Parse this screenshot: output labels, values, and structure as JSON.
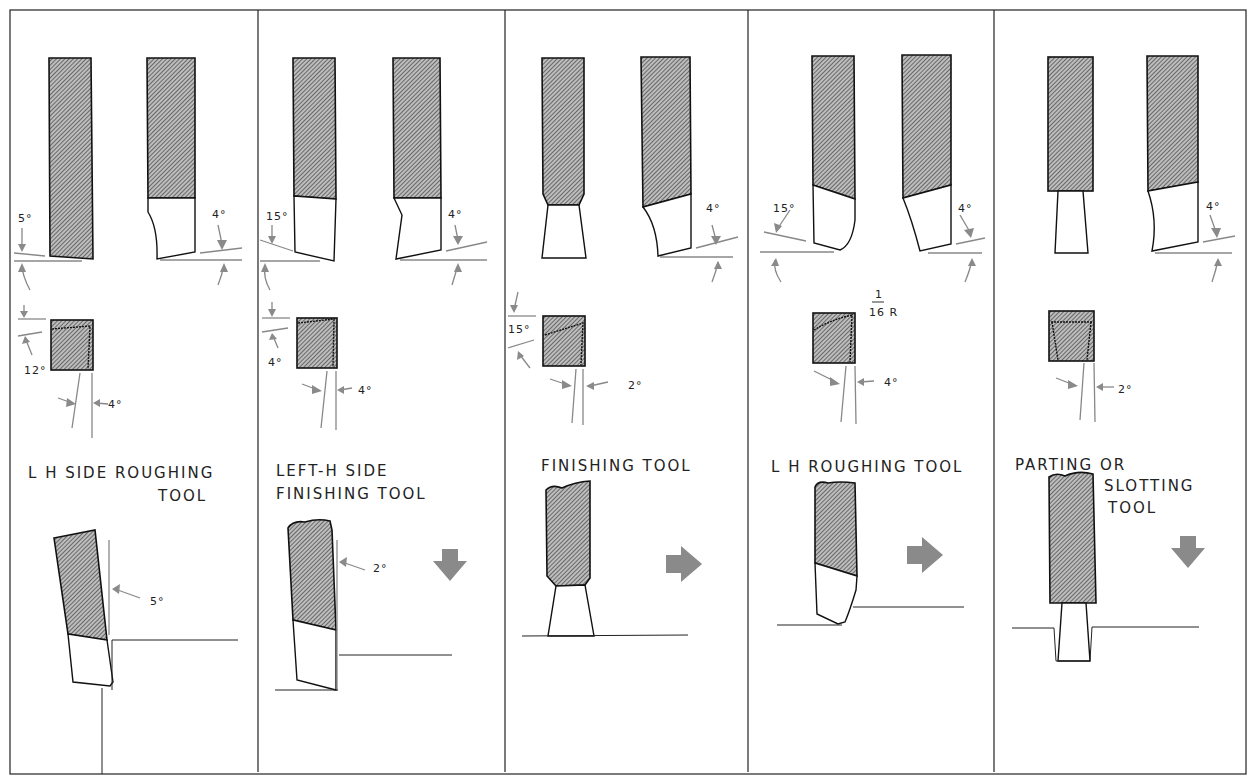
{
  "figure": {
    "type": "technical-drawing",
    "panels": [
      {
        "id": "lh-side-roughing",
        "title_line1": "L H SIDE ROUGHING",
        "title_line2": "TOOL",
        "angles": {
          "side_view_left": "5°",
          "side_view_right": "4°",
          "end_view_top": "12°",
          "end_view_bottom": "4°",
          "usage": "5°"
        },
        "feed_arrow": "none"
      },
      {
        "id": "left-h-side-finishing",
        "title_line1": "LEFT-H  SIDE",
        "title_line2": "FINISHING TOOL",
        "angles": {
          "side_view_left": "15°",
          "side_view_right": "4°",
          "end_view_top": "4°",
          "end_view_bottom": "4°",
          "usage": "2°"
        },
        "feed_arrow": "down"
      },
      {
        "id": "finishing",
        "title_line1": "FINISHING  TOOL",
        "title_line2": "",
        "angles": {
          "side_view_right": "4°",
          "end_view_top": "15°",
          "end_view_bottom": "2°"
        },
        "feed_arrow": "right"
      },
      {
        "id": "lh-roughing",
        "title_line1": "L H  ROUGHING TOOL",
        "title_line2": "",
        "angles": {
          "side_view_left": "15°",
          "side_view_right": "4°",
          "nose_radius_num": "1",
          "nose_radius_den": "16 R",
          "end_view_bottom": "4°"
        },
        "feed_arrow": "right"
      },
      {
        "id": "parting-slotting",
        "title_line1": "PARTING OR",
        "title_line2": "SLOTTING",
        "title_line3": "TOOL",
        "angles": {
          "side_view_right": "4°",
          "end_view_bottom": "2°"
        },
        "feed_arrow": "down"
      }
    ],
    "colors": {
      "ink": "#111111",
      "dimension": "#888888",
      "arrow": "#8a8a8a",
      "paper": "#ffffff"
    }
  }
}
